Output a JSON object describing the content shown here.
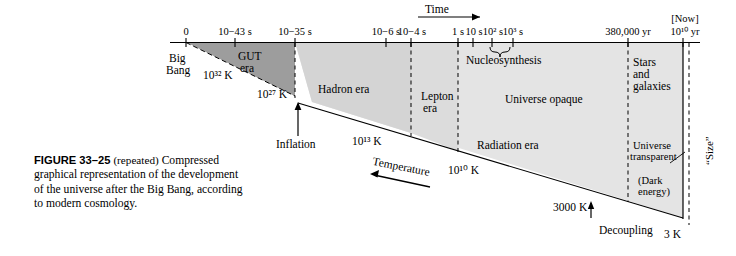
{
  "figure": {
    "number": "FIGURE 33–25",
    "repeated_note": "(repeated)",
    "caption": "Compressed graphical representation of the development of the universe after the Big Bang, according to modern cosmology."
  },
  "axis": {
    "arrow_label": "Time",
    "now_label": "[Now]",
    "ticks": [
      {
        "label": "0",
        "x": 186
      },
      {
        "label": "10−43 s",
        "x": 235
      },
      {
        "label": "10−35 s",
        "x": 295
      },
      {
        "label": "10−6 s",
        "x": 386
      },
      {
        "label": "10−4 s",
        "x": 411
      },
      {
        "label": "1 s",
        "x": 458
      },
      {
        "label": "10 s",
        "x": 473
      },
      {
        "label": "10² s",
        "x": 492
      },
      {
        "label": "10³ s",
        "x": 513
      },
      {
        "label": "380,000 yr",
        "x": 628
      },
      {
        "label": "10¹⁰ yr",
        "x": 685
      }
    ]
  },
  "eras": [
    {
      "name": "Big Bang",
      "line1": "Big",
      "line2": "Bang"
    },
    {
      "name": "GUT era",
      "line1": "GUT",
      "line2": "era"
    },
    {
      "name": "Hadron era",
      "line1": "Hadron era",
      "line2": ""
    },
    {
      "name": "Lepton era",
      "line1": "Lepton",
      "line2": "era"
    },
    {
      "name": "Nucleosynthesis",
      "line1": "Nucleosynthesis",
      "line2": ""
    },
    {
      "name": "Universe opaque",
      "line1": "Universe opaque",
      "line2": ""
    },
    {
      "name": "Radiation era",
      "line1": "Radiation era",
      "line2": ""
    },
    {
      "name": "Stars and galaxies",
      "line1": "Stars",
      "line2": "and",
      "line3": "galaxies"
    },
    {
      "name": "Universe transparent",
      "line1": "Universe",
      "line2": "transparent"
    },
    {
      "name": "Dark energy",
      "line1": "(Dark",
      "line2": "energy)"
    }
  ],
  "annotations": {
    "inflation": "Inflation",
    "decoupling": "Decoupling",
    "temperature_axis": "Temperature",
    "size_axis": "“Size”"
  },
  "temperatures": [
    {
      "label": "10³² K",
      "x": 203,
      "y": 69
    },
    {
      "label": "10²⁷ K",
      "x": 257,
      "y": 88
    },
    {
      "label": "10¹³ K",
      "x": 352,
      "y": 135
    },
    {
      "label": "10¹⁰ K",
      "x": 448,
      "y": 164
    },
    {
      "label": "3000 K",
      "x": 553,
      "y": 205
    },
    {
      "label": "3 K",
      "x": 664,
      "y": 231
    }
  ],
  "colors": {
    "gut_fill": "#9d9d9d",
    "hadron_fill": "#d2d2d2",
    "body_fill": "#e4e4e4",
    "line": "#000000",
    "page_bg": "#ffffff"
  }
}
